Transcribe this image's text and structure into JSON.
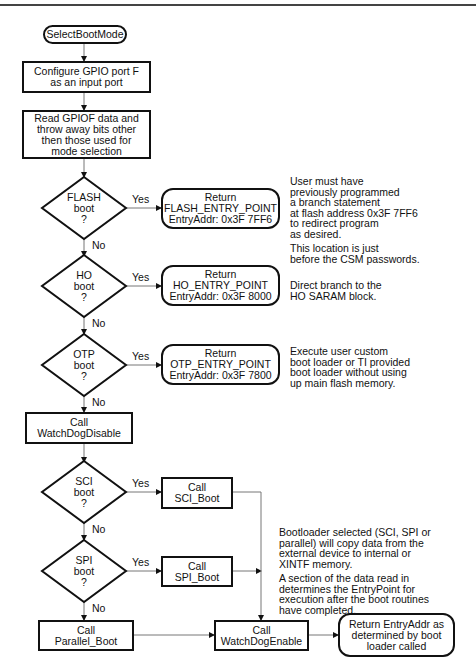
{
  "start": "SelectBootMode",
  "steps": {
    "configure": [
      "Configure GPIO port F",
      "as an input port"
    ],
    "read": [
      "Read GPIOF data and",
      "throw away bits other",
      "then those used for",
      "mode selection"
    ],
    "wd_disable": [
      "Call",
      "WatchDogDisable"
    ],
    "parallel": [
      "Call",
      "Parallel_Boot"
    ],
    "sci": [
      "Call",
      "SCI_Boot"
    ],
    "spi": [
      "Call",
      "SPI_Boot"
    ],
    "wd_enable": [
      "Call",
      "WatchDogEnable"
    ]
  },
  "decisions": {
    "flash": [
      "FLASH",
      "boot",
      "?"
    ],
    "ho": [
      "HO",
      "boot",
      "?"
    ],
    "otp": [
      "OTP",
      "boot",
      "?"
    ],
    "sci": [
      "SCI",
      "boot",
      "?"
    ],
    "spi": [
      "SPI",
      "boot",
      "?"
    ]
  },
  "returns": {
    "flash": [
      "Return",
      "FLASH_ENTRY_POINT",
      "EntryAddr: 0x3F 7FF6"
    ],
    "ho": [
      "Return",
      "HO_ENTRY_POINT",
      "EntryAddr: 0x3F 8000"
    ],
    "otp": [
      "Return",
      "OTP_ENTRY_POINT",
      "EntryAddr: 0x3F 7800"
    ],
    "final": [
      "Return EntryAddr as",
      "determined by boot",
      "loader called"
    ]
  },
  "labels": {
    "yes": "Yes",
    "no": "No"
  },
  "notes": {
    "flash": [
      [
        "User must have",
        "previously programmed",
        "a branch statement",
        "at flash address 0x3F 7FF6",
        "to redirect program",
        "as desired."
      ],
      [
        "This location is just",
        "before the CSM passwords."
      ]
    ],
    "ho": [
      [
        "Direct branch to the",
        "HO SARAM block."
      ]
    ],
    "otp": [
      [
        "Execute user custom",
        "boot loader or TI provided",
        "boot loader without using",
        "up main flash memory."
      ]
    ],
    "bootloader": [
      [
        "Bootloader selected (SCI, SPI or",
        "parallel) will copy data from the",
        "external device to internal or",
        "XINTF memory."
      ],
      [
        "A section of the data read in",
        "determines the EntryPoint for",
        "execution after the boot routines",
        "have completed."
      ]
    ]
  }
}
